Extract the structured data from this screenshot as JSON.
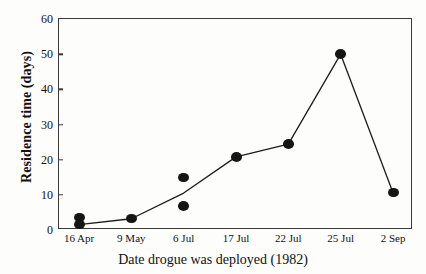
{
  "chart_data": {
    "type": "scatter",
    "title": "",
    "xlabel": "Date drogue was deployed (1982)",
    "ylabel": "Residence time (days)",
    "categories": [
      "16 Apr",
      "9 May",
      "6 Jul",
      "17 Jul",
      "22 Jul",
      "25 Jul",
      "2 Sep"
    ],
    "ylim": [
      0,
      60
    ],
    "yticks": [
      0,
      10,
      20,
      30,
      40,
      50,
      60
    ],
    "ytick_labels": [
      "0",
      "10",
      "20",
      "30",
      "40",
      "50",
      "60"
    ],
    "grid": false,
    "legend": "none",
    "marker": "filled-circle",
    "points": [
      {
        "category": "16 Apr",
        "x_index": 0,
        "value": 3.5
      },
      {
        "category": "16 Apr",
        "x_index": 0,
        "value": 1.5
      },
      {
        "category": "9 May",
        "x_index": 1,
        "value": 3.2
      },
      {
        "category": "6 Jul",
        "x_index": 2,
        "value": 15.0
      },
      {
        "category": "6 Jul",
        "x_index": 2,
        "value": 6.8
      },
      {
        "category": "17 Jul",
        "x_index": 3,
        "value": 20.8
      },
      {
        "category": "22 Jul",
        "x_index": 4,
        "value": 24.4
      },
      {
        "category": "25 Jul",
        "x_index": 5,
        "value": 50.0
      },
      {
        "category": "2 Sep",
        "x_index": 6,
        "value": 10.6
      }
    ],
    "series": [
      {
        "name": "Residence time",
        "connected_values": [
          1.5,
          3.2,
          10.5,
          20.8,
          24.4,
          50.0,
          10.6
        ]
      }
    ]
  },
  "axes": {
    "y_title": "Residence time (days)",
    "x_title": "Date drogue was deployed (1982)"
  }
}
